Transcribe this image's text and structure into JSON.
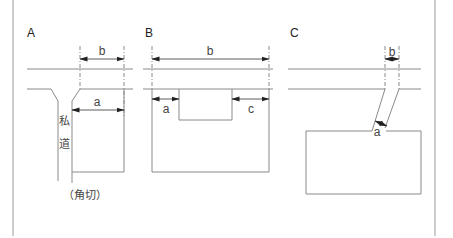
{
  "diagram": {
    "panels": [
      {
        "id": "A",
        "label": "A",
        "dimensions": [
          "b",
          "a"
        ],
        "road_label_chars": [
          "私",
          "道"
        ],
        "note": "（角切）"
      },
      {
        "id": "B",
        "label": "B",
        "dimensions": [
          "b",
          "a",
          "c"
        ]
      },
      {
        "id": "C",
        "label": "C",
        "dimensions": [
          "b",
          "a"
        ]
      }
    ],
    "colors": {
      "line": "#8a8a8a",
      "dimension": "#333333",
      "border": "#bdbdbd"
    }
  }
}
